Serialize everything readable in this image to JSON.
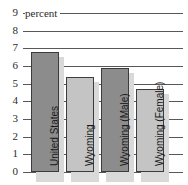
{
  "chart_data": {
    "type": "bar",
    "title": "",
    "subtitle": "",
    "xlabel": "",
    "ylabel": "percent",
    "ylim": [
      0,
      9
    ],
    "yticks": [
      9,
      8,
      7,
      6,
      5,
      4,
      3,
      2,
      1,
      0
    ],
    "grid": true,
    "legend": "none",
    "categories": [
      "United States",
      "Wyoming",
      "Wyoming (Male)",
      "Wyoming (Female)"
    ],
    "values": [
      6.8,
      5.4,
      5.9,
      4.7
    ],
    "bar_colors": [
      "#8c8c8c",
      "#c4c4c4",
      "#8c8c8c",
      "#c4c4c4"
    ],
    "annotations": []
  },
  "axis": {
    "unit_label": "percent"
  },
  "colors": {
    "axis": "#58585a",
    "bar_dark": "#8c8c8c",
    "bar_light": "#c4c4c4",
    "bar_border": "#3c3c3c",
    "shadow": "#d9d9d9",
    "text": "#2b2b2b",
    "background": "#ffffff"
  }
}
